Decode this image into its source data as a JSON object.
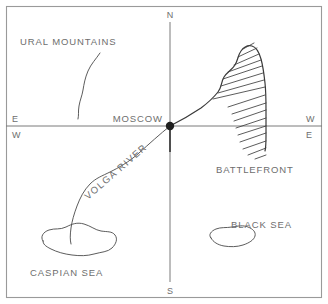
{
  "map": {
    "kind": "hand-drawn-sketch-map",
    "background_color": "#ffffff",
    "ink_color": "#4a4a4a",
    "label_color": "#6e6e6e",
    "border": {
      "present": true,
      "color": "#9a9a9a",
      "x": 6,
      "y": 6,
      "width": 316,
      "height": 292
    },
    "compass": {
      "north_label": "N",
      "south_label": "S",
      "west_label": "W",
      "east_label": "E",
      "left_edge_upper_label": "E",
      "left_edge_lower_label": "W",
      "right_edge_upper_label": "W",
      "right_edge_lower_label": "E",
      "origin_x": 170,
      "origin_y": 126
    },
    "axes": {
      "vertical_x": 170,
      "vertical_top_y": 22,
      "vertical_bottom_y": 282,
      "horizontal_y": 126,
      "horizontal_left_x": 6,
      "horizontal_right_x": 322
    },
    "city": {
      "name": "MOSCOW",
      "label": "MOSCOW",
      "marker": "filled-dot",
      "x": 170,
      "y": 126,
      "label_x": 163,
      "label_y": 122,
      "dot_radius": 4.2
    },
    "features": [
      {
        "id": "ural-mountains",
        "label": "URAL MOUNTAINS",
        "type": "mountain-range",
        "label_x": 20,
        "label_y": 45
      },
      {
        "id": "volga-river",
        "label": "VOLGA RIVER",
        "type": "river",
        "label_rotation_deg": -41,
        "label_x": 88,
        "label_y": 200
      },
      {
        "id": "battlefront",
        "label": "BATTLEFRONT",
        "type": "front-line",
        "hatching_side": "east",
        "label_x": 216,
        "label_y": 173
      },
      {
        "id": "caspian-sea",
        "label": "CASPIAN SEA",
        "type": "sea",
        "label_x": 30,
        "label_y": 276
      },
      {
        "id": "black-sea",
        "label": "BLACK SEA",
        "type": "sea",
        "label_x": 231,
        "label_y": 228
      }
    ]
  }
}
